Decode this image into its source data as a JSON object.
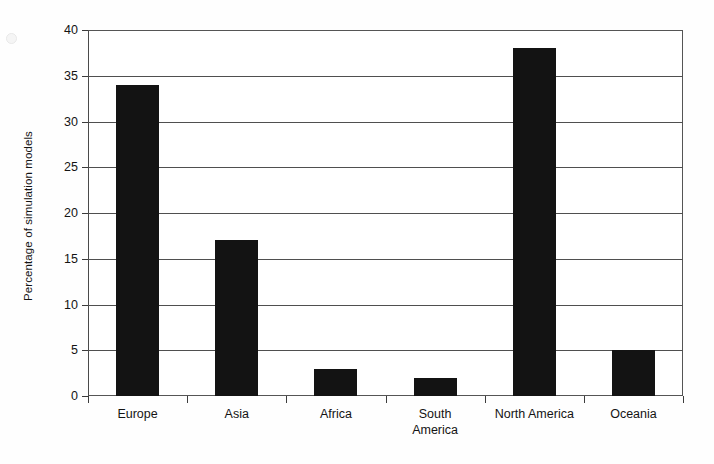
{
  "chart_data": {
    "type": "bar",
    "title": "",
    "xlabel": "",
    "ylabel": "Percentage of simulation models",
    "categories": [
      "Europe",
      "Asia",
      "Africa",
      "South\nAmerica",
      "North America",
      "Oceania"
    ],
    "values": [
      34,
      17,
      3,
      2,
      38,
      5
    ],
    "ylim": [
      0,
      40
    ],
    "ytick_values": [
      0,
      5,
      10,
      15,
      20,
      25,
      30,
      35,
      40
    ],
    "ytick_labels": [
      "0",
      "5",
      "10",
      "15",
      "20",
      "25",
      "30",
      "35",
      "40"
    ],
    "grid": "horizontal",
    "legend": "none",
    "bar_color": "#131313",
    "grid_color": "#4f4f4f",
    "axis_color": "#3a3a3a",
    "background_color": "#ffffff"
  }
}
